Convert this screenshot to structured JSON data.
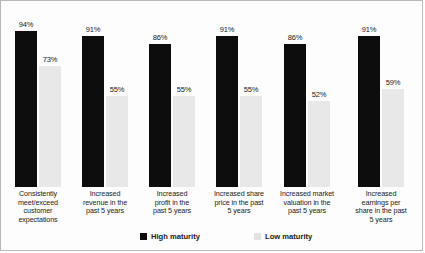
{
  "chart_data": {
    "type": "bar",
    "title": "",
    "xlabel": "",
    "ylabel": "",
    "ylim": [
      0,
      100
    ],
    "grid": false,
    "legend_position": "bottom",
    "categories": [
      "Consistently meet/exceed customer expectations",
      "Increased revenue in the past 5 years",
      "Increased profit in the past 5 years",
      "Increased share price in the past 5 years",
      "Increased market valuation in the past 5 years",
      "Increased earnings per share in the past 5 years"
    ],
    "category_lines": [
      [
        "Consistently",
        "meet/exceed",
        "customer",
        "expectations"
      ],
      [
        "Increased",
        "revenue in the",
        "past 5 years"
      ],
      [
        "Increased",
        "profit in the",
        "past 5 years"
      ],
      [
        "Increased share",
        "price in the past",
        "5 years"
      ],
      [
        "Increased market",
        "valuation in the",
        "past 5 years"
      ],
      [
        "Increased",
        "earnings per",
        "share in the past",
        "5 years"
      ]
    ],
    "series": [
      {
        "name": "High maturity",
        "color": "#0d0d0d",
        "values": [
          94,
          91,
          86,
          91,
          86,
          91
        ],
        "labels": [
          "94%",
          "91%",
          "86%",
          "91%",
          "86%",
          "91%"
        ]
      },
      {
        "name": "Low maturity",
        "color": "#e8e8e8",
        "values": [
          73,
          55,
          55,
          55,
          52,
          59
        ],
        "labels": [
          "73%",
          "55%",
          "55%",
          "55%",
          "52%",
          "59%"
        ]
      }
    ]
  },
  "legend": {
    "items": [
      {
        "label": "High maturity",
        "swatch": "high"
      },
      {
        "label": "Low maturity",
        "swatch": "low"
      }
    ]
  }
}
